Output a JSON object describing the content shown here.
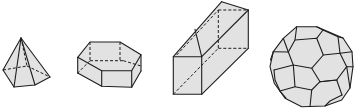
{
  "figure": {
    "colors": {
      "fill": "#e2e2e2",
      "stroke": "#1e1e1e",
      "background": "#ffffff"
    },
    "shapes": [
      {
        "id": "pentagonal-pyramid",
        "name": "Pentagonal pyramid"
      },
      {
        "id": "hexagonal-prism",
        "name": "Hexagonal prism"
      },
      {
        "id": "square-prism",
        "name": "Square prism (cuboid)"
      },
      {
        "id": "truncated-icosahedron",
        "name": "Truncated icosahedron (soccer ball)"
      }
    ]
  }
}
